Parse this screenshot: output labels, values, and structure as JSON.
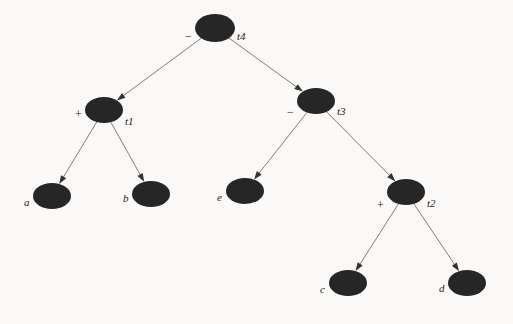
{
  "figure": {
    "background_color": "#fbfaf8",
    "node_fill": "#262626",
    "edge_color": "#6e6e6e",
    "text_color": "#1c1c1c"
  },
  "nodes": [
    {
      "id": "t4",
      "name": "t4",
      "operator": "−",
      "kind": "internal",
      "cx": 215,
      "cy": 28,
      "rx": 20,
      "ry": 14,
      "name_dx": 22,
      "name_dy": 3,
      "op_dx": -30,
      "op_dy": 2
    },
    {
      "id": "t1",
      "name": "t1",
      "operator": "+",
      "kind": "internal",
      "cx": 104,
      "cy": 110,
      "rx": 19,
      "ry": 13,
      "name_dx": 21,
      "name_dy": 6,
      "op_dx": -29,
      "op_dy": -2
    },
    {
      "id": "t3",
      "name": "t3",
      "operator": "−",
      "kind": "internal",
      "cx": 316,
      "cy": 101,
      "rx": 19,
      "ry": 13,
      "name_dx": 21,
      "name_dy": 5,
      "op_dx": -29,
      "op_dy": 5
    },
    {
      "id": "t2",
      "name": "t2",
      "operator": "+",
      "kind": "internal",
      "cx": 406,
      "cy": 192,
      "rx": 19,
      "ry": 13,
      "name_dx": 21,
      "name_dy": 6,
      "op_dx": -29,
      "op_dy": 7
    },
    {
      "id": "a",
      "name": "a",
      "operator": "",
      "kind": "leaf",
      "cx": 52,
      "cy": 196,
      "rx": 19,
      "ry": 13,
      "name_dx": -28,
      "name_dy": 1,
      "op_dx": 0,
      "op_dy": 0
    },
    {
      "id": "b",
      "name": "b",
      "operator": "",
      "kind": "leaf",
      "cx": 151,
      "cy": 194,
      "rx": 19,
      "ry": 13,
      "name_dx": -28,
      "name_dy": -1,
      "op_dx": 0,
      "op_dy": 0
    },
    {
      "id": "e",
      "name": "e",
      "operator": "",
      "kind": "leaf",
      "cx": 245,
      "cy": 191,
      "rx": 19,
      "ry": 13,
      "name_dx": -28,
      "name_dy": 1,
      "op_dx": 0,
      "op_dy": 0
    },
    {
      "id": "c",
      "name": "c",
      "operator": "",
      "kind": "leaf",
      "cx": 348,
      "cy": 283,
      "rx": 19,
      "ry": 13,
      "name_dx": -28,
      "name_dy": 1,
      "op_dx": 0,
      "op_dy": 0
    },
    {
      "id": "d",
      "name": "d",
      "operator": "",
      "kind": "leaf",
      "cx": 467,
      "cy": 283,
      "rx": 19,
      "ry": 13,
      "name_dx": -28,
      "name_dy": 0,
      "op_dx": 0,
      "op_dy": 0
    }
  ],
  "edges": [
    {
      "from": "t4",
      "to": "t1"
    },
    {
      "from": "t4",
      "to": "t3"
    },
    {
      "from": "t1",
      "to": "a"
    },
    {
      "from": "t1",
      "to": "b"
    },
    {
      "from": "t3",
      "to": "e"
    },
    {
      "from": "t3",
      "to": "t2"
    },
    {
      "from": "t2",
      "to": "c"
    },
    {
      "from": "t2",
      "to": "d"
    }
  ]
}
